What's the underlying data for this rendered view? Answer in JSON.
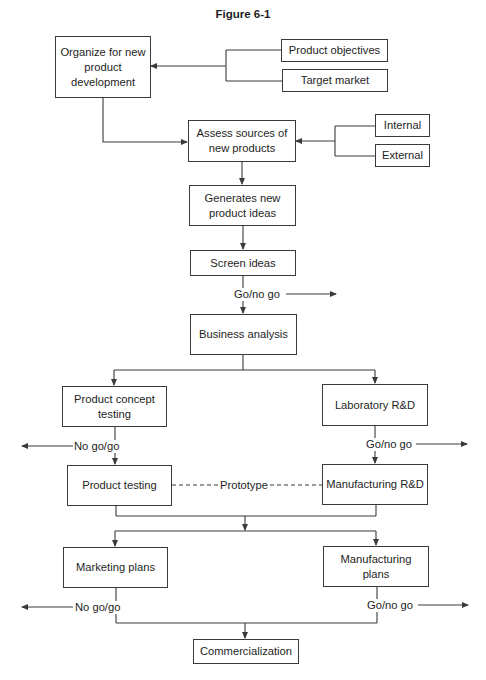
{
  "figure": {
    "title": "Figure 6-1"
  },
  "nodes": {
    "organize": "Organize for new product development",
    "product_objectives": "Product objectives",
    "target_market": "Target market",
    "assess_sources": "Assess sources of new products",
    "internal": "Internal",
    "external": "External",
    "generate_ideas": "Generates new product ideas",
    "screen_ideas": "Screen ideas",
    "business_analysis": "Business analysis",
    "concept_testing": "Product concept testing",
    "lab_rd": "Laboratory R&D",
    "product_testing": "Product testing",
    "manufacturing_rd": "Manufacturing R&D",
    "marketing_plans": "Marketing plans",
    "manufacturing_plans": "Manufacturing plans",
    "commercialization": "Commercialization"
  },
  "edge_labels": {
    "screen_decision": "Go/no go",
    "concept_decision": "No go/go",
    "lab_decision": "Go/no go",
    "prototype": "Prototype",
    "marketing_decision": "No go/go",
    "manufacturing_decision": "Go/no go"
  },
  "colors": {
    "line": "#3a3a3a",
    "text": "#1e1e1e",
    "background": "#ffffff"
  }
}
